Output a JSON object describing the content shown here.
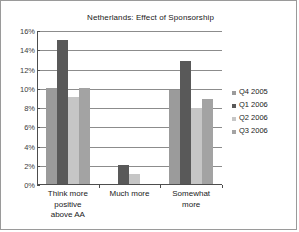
{
  "chart_data": {
    "type": "bar",
    "title": "Netherlands: Effect of Sponsorship",
    "xlabel": "",
    "ylabel": "",
    "ylim": [
      0,
      16
    ],
    "ytick_labels": [
      "16%",
      "14%",
      "12%",
      "10%",
      "8%",
      "6%",
      "4%",
      "2%",
      "0%"
    ],
    "ytick_values": [
      16,
      14,
      12,
      10,
      8,
      6,
      4,
      2,
      0
    ],
    "grid": "horizontal",
    "legend_position": "right",
    "categories": [
      "Think more positive above AA",
      "Much more",
      "Somewhat more"
    ],
    "category_lines": [
      [
        "Think more",
        "positive",
        "above AA"
      ],
      [
        "Much more"
      ],
      [
        "Somewhat",
        "more"
      ]
    ],
    "series": [
      {
        "name": "Q4 2005",
        "color": "#9b9b9b",
        "values": [
          10.0,
          0,
          9.8
        ]
      },
      {
        "name": "Q1 2006",
        "color": "#595959",
        "values": [
          15.0,
          2.0,
          12.8
        ]
      },
      {
        "name": "Q2 2006",
        "color": "#c6c6c6",
        "values": [
          9.0,
          1.0,
          7.9
        ]
      },
      {
        "name": "Q3 2006",
        "color": "#a3a3a3",
        "values": [
          10.0,
          0,
          8.8
        ]
      }
    ]
  },
  "legend": {
    "items": [
      {
        "label": "Q4 2005",
        "color": "#9b9b9b"
      },
      {
        "label": "Q1 2006",
        "color": "#595959"
      },
      {
        "label": "Q2 2006",
        "color": "#c6c6c6"
      },
      {
        "label": "Q3 2006",
        "color": "#a3a3a3"
      }
    ]
  }
}
